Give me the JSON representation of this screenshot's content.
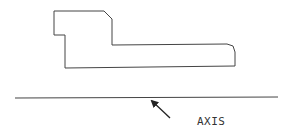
{
  "diagram": {
    "part_outline": {
      "stroke": "#333333",
      "points": [
        [
          54,
          11
        ],
        [
          104,
          11
        ],
        [
          112,
          19
        ],
        [
          112,
          45
        ],
        [
          227,
          44
        ],
        [
          235,
          50
        ],
        [
          235,
          66
        ],
        [
          65,
          68
        ],
        [
          65,
          35
        ],
        [
          54,
          35
        ]
      ]
    },
    "axis_line": {
      "x1": 15,
      "y1": 98,
      "x2": 278,
      "y2": 97,
      "stroke": "#333333"
    },
    "arrow": {
      "from": [
        170,
        118
      ],
      "to": [
        150,
        99
      ]
    },
    "axis_label": {
      "text": "AXIS",
      "x": 197,
      "y": 125
    }
  }
}
